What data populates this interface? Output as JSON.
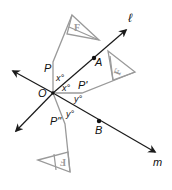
{
  "diagram": {
    "points": {
      "O": "O",
      "A": "A",
      "B": "B",
      "P": "P",
      "P_prime": "P'",
      "P_double_prime": "P\""
    },
    "lines": {
      "l": "ℓ",
      "m": "m"
    },
    "angles": {
      "x_upper": "x°",
      "x_lower": "x°",
      "y_upper": "y°",
      "y_lower": "y°"
    },
    "figures": {
      "original": "F",
      "first_image": "F",
      "second_image": "F"
    },
    "colors": {
      "lines": "#1a1a1a",
      "figures": "#9a9a9a"
    }
  }
}
